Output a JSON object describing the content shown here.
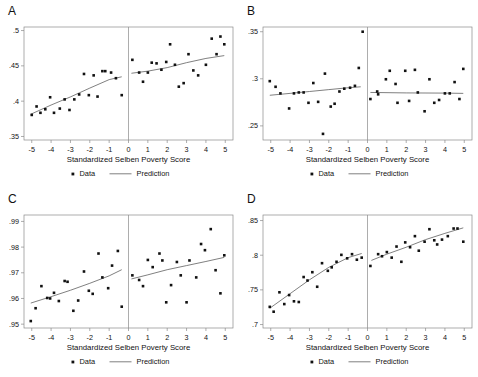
{
  "figure": {
    "width": 478,
    "height": 377,
    "background": "#ffffff",
    "marker_color": "#111111",
    "line_color": "#555555",
    "axis_color": "#8a8a8a"
  },
  "legend": {
    "data_label": "Data",
    "prediction_label": "Prediction"
  },
  "shared": {
    "xlabel": "Standardized Selben Poverty Score",
    "xticks": [
      -5,
      -4,
      -3,
      -2,
      -1,
      0,
      1,
      2,
      3,
      4,
      5
    ],
    "xticklabels": [
      "-5",
      "-4",
      "-3",
      "-2",
      "-1",
      "0",
      "1",
      "2",
      "3",
      "4",
      "5"
    ],
    "xlim": [
      -5.4,
      5.4
    ],
    "discontinuity_x": 0
  },
  "chart_data": [
    {
      "id": "A",
      "panel_letter": "A",
      "type": "scatter",
      "title": "",
      "xlabel": "Standardized Selben Poverty Score",
      "ylabel": "",
      "xlim": [
        -5.4,
        5.4
      ],
      "ylim": [
        0.345,
        0.505
      ],
      "yticks": [
        0.35,
        0.4,
        0.45,
        0.5
      ],
      "yticklabels": [
        ".35",
        ".4",
        ".45",
        ".5"
      ],
      "grid": false,
      "legend_position": "below",
      "cutoff": 0,
      "points": [
        {
          "x": -5.0,
          "y": 0.3805
        },
        {
          "x": -4.75,
          "y": 0.3925
        },
        {
          "x": -4.55,
          "y": 0.3835
        },
        {
          "x": -4.3,
          "y": 0.3885
        },
        {
          "x": -4.05,
          "y": 0.4055
        },
        {
          "x": -3.85,
          "y": 0.3835
        },
        {
          "x": -3.55,
          "y": 0.3895
        },
        {
          "x": -3.3,
          "y": 0.4025
        },
        {
          "x": -3.05,
          "y": 0.3875
        },
        {
          "x": -2.8,
          "y": 0.4025
        },
        {
          "x": -2.55,
          "y": 0.4095
        },
        {
          "x": -2.3,
          "y": 0.4385
        },
        {
          "x": -2.05,
          "y": 0.4085
        },
        {
          "x": -1.8,
          "y": 0.4365
        },
        {
          "x": -1.6,
          "y": 0.4065
        },
        {
          "x": -1.35,
          "y": 0.4425
        },
        {
          "x": -1.2,
          "y": 0.4425
        },
        {
          "x": -0.9,
          "y": 0.4405
        },
        {
          "x": -0.65,
          "y": 0.4325
        },
        {
          "x": -0.35,
          "y": 0.4085
        },
        {
          "x": 0.2,
          "y": 0.4585
        },
        {
          "x": 0.55,
          "y": 0.4405
        },
        {
          "x": 0.75,
          "y": 0.4275
        },
        {
          "x": 1.0,
          "y": 0.4405
        },
        {
          "x": 1.2,
          "y": 0.4545
        },
        {
          "x": 1.45,
          "y": 0.4535
        },
        {
          "x": 1.7,
          "y": 0.4445
        },
        {
          "x": 1.95,
          "y": 0.4555
        },
        {
          "x": 2.15,
          "y": 0.4805
        },
        {
          "x": 2.4,
          "y": 0.4515
        },
        {
          "x": 2.6,
          "y": 0.4205
        },
        {
          "x": 2.85,
          "y": 0.4255
        },
        {
          "x": 3.1,
          "y": 0.4665
        },
        {
          "x": 3.35,
          "y": 0.4435
        },
        {
          "x": 3.6,
          "y": 0.4365
        },
        {
          "x": 4.0,
          "y": 0.4515
        },
        {
          "x": 4.3,
          "y": 0.4885
        },
        {
          "x": 4.55,
          "y": 0.4665
        },
        {
          "x": 4.75,
          "y": 0.4915
        },
        {
          "x": 4.95,
          "y": 0.4805
        }
      ],
      "fit_left": [
        {
          "x": -5.05,
          "y": 0.3815
        },
        {
          "x": -4.0,
          "y": 0.3945
        },
        {
          "x": -3.0,
          "y": 0.406
        },
        {
          "x": -2.0,
          "y": 0.4185
        },
        {
          "x": -1.0,
          "y": 0.4305
        },
        {
          "x": -0.35,
          "y": 0.4345
        }
      ],
      "fit_right": [
        {
          "x": 0.15,
          "y": 0.4395
        },
        {
          "x": 1.0,
          "y": 0.4425
        },
        {
          "x": 2.0,
          "y": 0.4475
        },
        {
          "x": 3.0,
          "y": 0.4545
        },
        {
          "x": 4.0,
          "y": 0.4605
        },
        {
          "x": 4.95,
          "y": 0.4645
        }
      ]
    },
    {
      "id": "B",
      "panel_letter": "B",
      "type": "scatter",
      "title": "",
      "xlabel": "Standardized Selben Poverty Score",
      "ylabel": "",
      "xlim": [
        -5.4,
        5.4
      ],
      "ylim": [
        0.235,
        0.355
      ],
      "yticks": [
        0.25,
        0.3,
        0.35
      ],
      "yticklabels": [
        ".25",
        ".3",
        ".35"
      ],
      "grid": false,
      "legend_position": "below",
      "cutoff": 0,
      "points": [
        {
          "x": -5.05,
          "y": 0.2975
        },
        {
          "x": -4.75,
          "y": 0.2915
        },
        {
          "x": -4.5,
          "y": 0.2845
        },
        {
          "x": -4.05,
          "y": 0.2685
        },
        {
          "x": -3.8,
          "y": 0.2845
        },
        {
          "x": -3.55,
          "y": 0.2855
        },
        {
          "x": -3.3,
          "y": 0.2855
        },
        {
          "x": -3.05,
          "y": 0.2745
        },
        {
          "x": -2.8,
          "y": 0.2955
        },
        {
          "x": -2.55,
          "y": 0.2755
        },
        {
          "x": -2.3,
          "y": 0.2415
        },
        {
          "x": -2.2,
          "y": 0.3055
        },
        {
          "x": -1.9,
          "y": 0.2705
        },
        {
          "x": -1.7,
          "y": 0.2735
        },
        {
          "x": -1.45,
          "y": 0.2865
        },
        {
          "x": -1.2,
          "y": 0.2895
        },
        {
          "x": -0.9,
          "y": 0.2905
        },
        {
          "x": -0.65,
          "y": 0.2925
        },
        {
          "x": -0.45,
          "y": 0.3115
        },
        {
          "x": -0.25,
          "y": 0.35
        },
        {
          "x": 0.15,
          "y": 0.2785
        },
        {
          "x": 0.5,
          "y": 0.2865
        },
        {
          "x": 0.55,
          "y": 0.2835
        },
        {
          "x": 0.95,
          "y": 0.2995
        },
        {
          "x": 1.15,
          "y": 0.3085
        },
        {
          "x": 1.45,
          "y": 0.2945
        },
        {
          "x": 1.55,
          "y": 0.2745
        },
        {
          "x": 1.95,
          "y": 0.3085
        },
        {
          "x": 2.15,
          "y": 0.2765
        },
        {
          "x": 2.45,
          "y": 0.3095
        },
        {
          "x": 2.6,
          "y": 0.2855
        },
        {
          "x": 2.95,
          "y": 0.2655
        },
        {
          "x": 3.2,
          "y": 0.2995
        },
        {
          "x": 3.45,
          "y": 0.2745
        },
        {
          "x": 3.7,
          "y": 0.2775
        },
        {
          "x": 4.0,
          "y": 0.2845
        },
        {
          "x": 4.25,
          "y": 0.2845
        },
        {
          "x": 4.5,
          "y": 0.2965
        },
        {
          "x": 4.75,
          "y": 0.2785
        },
        {
          "x": 4.95,
          "y": 0.3105
        }
      ],
      "fit_left": [
        {
          "x": -5.05,
          "y": 0.2825
        },
        {
          "x": -4.0,
          "y": 0.2845
        },
        {
          "x": -3.0,
          "y": 0.2865
        },
        {
          "x": -2.0,
          "y": 0.2885
        },
        {
          "x": -1.0,
          "y": 0.2905
        },
        {
          "x": -0.35,
          "y": 0.2915
        }
      ],
      "fit_right": [
        {
          "x": 0.15,
          "y": 0.2855
        },
        {
          "x": 2.0,
          "y": 0.285
        },
        {
          "x": 4.0,
          "y": 0.2848
        },
        {
          "x": 4.95,
          "y": 0.2845
        }
      ]
    },
    {
      "id": "C",
      "panel_letter": "C",
      "type": "scatter",
      "title": "",
      "xlabel": "Standardized Selben Poverty Score",
      "ylabel": "",
      "xlim": [
        -5.4,
        5.4
      ],
      "ylim": [
        0.9485,
        0.9925
      ],
      "yticks": [
        0.95,
        0.96,
        0.97,
        0.98,
        0.99
      ],
      "yticklabels": [
        ".95",
        ".96",
        ".97",
        ".98",
        ".99"
      ],
      "grid": false,
      "legend_position": "below",
      "cutoff": 0,
      "points": [
        {
          "x": -5.05,
          "y": 0.9512
        },
        {
          "x": -4.8,
          "y": 0.9562
        },
        {
          "x": -4.5,
          "y": 0.9648
        },
        {
          "x": -4.2,
          "y": 0.9602
        },
        {
          "x": -4.05,
          "y": 0.96
        },
        {
          "x": -3.85,
          "y": 0.9622
        },
        {
          "x": -3.6,
          "y": 0.959
        },
        {
          "x": -3.3,
          "y": 0.9668
        },
        {
          "x": -3.15,
          "y": 0.9665
        },
        {
          "x": -2.85,
          "y": 0.9552
        },
        {
          "x": -2.6,
          "y": 0.9592
        },
        {
          "x": -2.3,
          "y": 0.9705
        },
        {
          "x": -2.05,
          "y": 0.963
        },
        {
          "x": -1.85,
          "y": 0.9618
        },
        {
          "x": -1.55,
          "y": 0.9775
        },
        {
          "x": -1.35,
          "y": 0.9682
        },
        {
          "x": -1.05,
          "y": 0.964
        },
        {
          "x": -0.85,
          "y": 0.9728
        },
        {
          "x": -0.55,
          "y": 0.9785
        },
        {
          "x": -0.35,
          "y": 0.9568
        },
        {
          "x": 0.2,
          "y": 0.969
        },
        {
          "x": 0.55,
          "y": 0.9672
        },
        {
          "x": 0.75,
          "y": 0.9648
        },
        {
          "x": 1.0,
          "y": 0.975
        },
        {
          "x": 1.25,
          "y": 0.9722
        },
        {
          "x": 1.6,
          "y": 0.9775
        },
        {
          "x": 1.75,
          "y": 0.9748
        },
        {
          "x": 1.95,
          "y": 0.9585
        },
        {
          "x": 2.2,
          "y": 0.9652
        },
        {
          "x": 2.5,
          "y": 0.9742
        },
        {
          "x": 2.7,
          "y": 0.969
        },
        {
          "x": 3.0,
          "y": 0.9585
        },
        {
          "x": 3.15,
          "y": 0.9748
        },
        {
          "x": 3.5,
          "y": 0.9682
        },
        {
          "x": 3.75,
          "y": 0.9812
        },
        {
          "x": 3.95,
          "y": 0.9788
        },
        {
          "x": 4.25,
          "y": 0.987
        },
        {
          "x": 4.5,
          "y": 0.971
        },
        {
          "x": 4.75,
          "y": 0.962
        },
        {
          "x": 4.95,
          "y": 0.9768
        }
      ],
      "fit_left": [
        {
          "x": -5.05,
          "y": 0.9582
        },
        {
          "x": -4.0,
          "y": 0.9607
        },
        {
          "x": -3.0,
          "y": 0.9632
        },
        {
          "x": -2.0,
          "y": 0.9659
        },
        {
          "x": -1.0,
          "y": 0.9688
        },
        {
          "x": -0.35,
          "y": 0.9712
        }
      ],
      "fit_right": [
        {
          "x": 0.15,
          "y": 0.9676
        },
        {
          "x": 1.0,
          "y": 0.9692
        },
        {
          "x": 2.0,
          "y": 0.9712
        },
        {
          "x": 3.0,
          "y": 0.9728
        },
        {
          "x": 4.0,
          "y": 0.9744
        },
        {
          "x": 4.95,
          "y": 0.976
        }
      ]
    },
    {
      "id": "D",
      "panel_letter": "D",
      "type": "scatter",
      "title": "",
      "xlabel": "Standardized Selben Poverty Score",
      "ylabel": "",
      "xlim": [
        -5.4,
        5.4
      ],
      "ylim": [
        0.695,
        0.858
      ],
      "yticks": [
        0.7,
        0.75,
        0.8,
        0.85
      ],
      "yticklabels": [
        ".7",
        ".75",
        ".8",
        ".85"
      ],
      "grid": false,
      "legend_position": "below",
      "cutoff": 0,
      "points": [
        {
          "x": -5.05,
          "y": 0.7255
        },
        {
          "x": -4.85,
          "y": 0.7185
        },
        {
          "x": -4.55,
          "y": 0.7465
        },
        {
          "x": -4.3,
          "y": 0.7295
        },
        {
          "x": -4.05,
          "y": 0.7425
        },
        {
          "x": -3.8,
          "y": 0.7335
        },
        {
          "x": -3.55,
          "y": 0.7325
        },
        {
          "x": -3.3,
          "y": 0.7685
        },
        {
          "x": -3.1,
          "y": 0.7635
        },
        {
          "x": -2.85,
          "y": 0.7755
        },
        {
          "x": -2.6,
          "y": 0.7545
        },
        {
          "x": -2.35,
          "y": 0.7885
        },
        {
          "x": -2.05,
          "y": 0.7775
        },
        {
          "x": -1.85,
          "y": 0.7825
        },
        {
          "x": -1.6,
          "y": 0.7905
        },
        {
          "x": -1.35,
          "y": 0.8005
        },
        {
          "x": -1.05,
          "y": 0.7955
        },
        {
          "x": -0.8,
          "y": 0.8015
        },
        {
          "x": -0.55,
          "y": 0.7935
        },
        {
          "x": -0.3,
          "y": 0.7965
        },
        {
          "x": 0.15,
          "y": 0.7845
        },
        {
          "x": 0.55,
          "y": 0.8015
        },
        {
          "x": 0.75,
          "y": 0.7985
        },
        {
          "x": 1.0,
          "y": 0.8045
        },
        {
          "x": 1.25,
          "y": 0.7965
        },
        {
          "x": 1.5,
          "y": 0.8125
        },
        {
          "x": 1.75,
          "y": 0.7905
        },
        {
          "x": 1.95,
          "y": 0.8185
        },
        {
          "x": 2.2,
          "y": 0.8115
        },
        {
          "x": 2.45,
          "y": 0.8275
        },
        {
          "x": 2.65,
          "y": 0.8065
        },
        {
          "x": 2.95,
          "y": 0.8195
        },
        {
          "x": 3.2,
          "y": 0.8375
        },
        {
          "x": 3.45,
          "y": 0.8215
        },
        {
          "x": 3.6,
          "y": 0.8155
        },
        {
          "x": 3.85,
          "y": 0.8225
        },
        {
          "x": 4.15,
          "y": 0.8275
        },
        {
          "x": 4.45,
          "y": 0.8385
        },
        {
          "x": 4.65,
          "y": 0.8385
        },
        {
          "x": 4.95,
          "y": 0.8195
        }
      ],
      "fit_left": [
        {
          "x": -5.05,
          "y": 0.7235
        },
        {
          "x": -4.0,
          "y": 0.7445
        },
        {
          "x": -3.0,
          "y": 0.7645
        },
        {
          "x": -2.0,
          "y": 0.7825
        },
        {
          "x": -1.0,
          "y": 0.7965
        },
        {
          "x": -0.3,
          "y": 0.8025
        }
      ],
      "fit_right": [
        {
          "x": 0.2,
          "y": 0.7925
        },
        {
          "x": 1.0,
          "y": 0.8015
        },
        {
          "x": 2.0,
          "y": 0.8115
        },
        {
          "x": 3.0,
          "y": 0.8225
        },
        {
          "x": 4.0,
          "y": 0.8315
        },
        {
          "x": 4.95,
          "y": 0.8395
        }
      ]
    }
  ]
}
